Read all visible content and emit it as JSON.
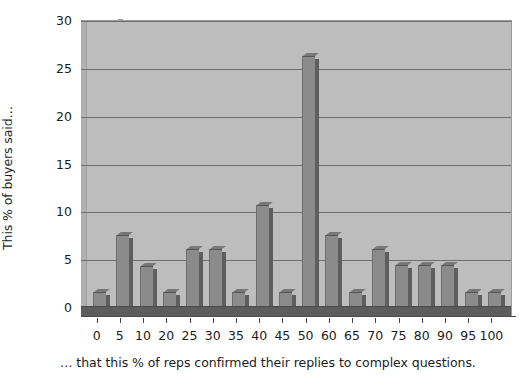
{
  "chart_data": {
    "type": "bar",
    "title": "",
    "subtitle": "",
    "xlabel": "… that this % of reps confirmed their replies to complex questions.",
    "ylabel": "This % of buyers said…",
    "categories": [
      "0",
      "5",
      "10",
      "20",
      "25",
      "30",
      "35",
      "40",
      "45",
      "50",
      "60",
      "65",
      "70",
      "75",
      "80",
      "90",
      "95",
      "100"
    ],
    "values": [
      1.6,
      7.5,
      4.3,
      1.6,
      6.1,
      6.1,
      1.6,
      10.7,
      1.6,
      26.2,
      7.5,
      1.6,
      6.1,
      4.4,
      4.4,
      4.4,
      1.6,
      1.6
    ],
    "ylim": [
      0,
      30
    ],
    "y_ticks": [
      "0",
      "5",
      "10",
      "15",
      "20",
      "25",
      "30"
    ],
    "y_tick_values": [
      0,
      5,
      10,
      15,
      20,
      25,
      30
    ],
    "grid": true,
    "legend": false,
    "legend_position": "none",
    "style": "3d-column",
    "colors": {
      "bar_face": "#8b8b8b",
      "bar_side": "#5e5e5e",
      "bar_top": "#787878",
      "plot_background": "#bdbdbd",
      "gridline": "#6f6f6f",
      "floor": "#5d5d5d",
      "axis": "#4a4a4a",
      "text": "#1c1c1c",
      "page_background": "#ffffff"
    }
  }
}
